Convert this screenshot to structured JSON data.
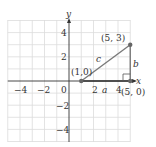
{
  "axes": {
    "x_label": "x",
    "y_label": "y",
    "x_ticks": [
      {
        "value": -4,
        "label": "−4"
      },
      {
        "value": -2,
        "label": "−2"
      },
      {
        "value": 0,
        "label": "0"
      },
      {
        "value": 2,
        "label": "2"
      },
      {
        "value": 4,
        "label": "4"
      }
    ],
    "y_ticks": [
      {
        "value": 4,
        "label": "4"
      },
      {
        "value": 2,
        "label": "2"
      },
      {
        "value": -2,
        "label": "−2"
      },
      {
        "value": -4,
        "label": "−4"
      }
    ],
    "range": {
      "x": [
        -5,
        5
      ],
      "y": [
        -5,
        5
      ]
    }
  },
  "points": [
    {
      "name": "A",
      "coords": [
        1,
        0
      ],
      "label": "(1,0)"
    },
    {
      "name": "B",
      "coords": [
        5,
        3
      ],
      "label": "(5, 3)"
    },
    {
      "name": "C",
      "coords": [
        5,
        0
      ],
      "label": "(5, 0)"
    }
  ],
  "sides": {
    "a": "a",
    "b": "b",
    "c": "c"
  },
  "colors": {
    "grid": "#d9d9d9",
    "axis": "#333333",
    "triangle": "#7a7a7a",
    "text": "#333333"
  }
}
